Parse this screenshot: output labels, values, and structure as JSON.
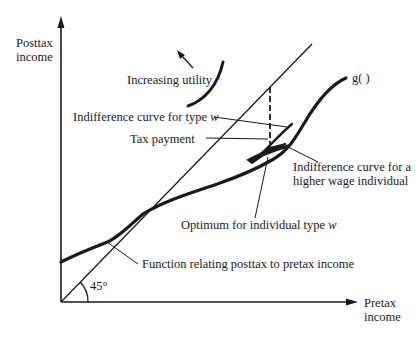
{
  "diagram": {
    "axes": {
      "y_label_line1": "Posttax",
      "y_label_line2": "income",
      "x_label_line1": "Pretax",
      "x_label_line2": "income"
    },
    "angle_label": "45°",
    "curve_label": "g( )",
    "annotations": {
      "increasing_utility": "Increasing utility",
      "indifference_type_w": "Indifference curve for type",
      "indifference_type_w_var": "w",
      "tax_payment": "Tax payment",
      "indifference_higher_line1": "Indifference curve for a",
      "indifference_higher_line2": "higher wage individual",
      "optimum": "Optimum for individual type",
      "optimum_var": "w",
      "function_relating": "Function relating posttax to pretax income"
    },
    "colors": {
      "ink": "#1a1a1a",
      "background": "#ffffff"
    }
  }
}
